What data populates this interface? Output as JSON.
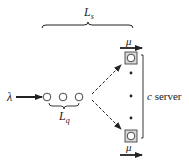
{
  "diagram": {
    "type": "queueing-system",
    "labels": {
      "arrival_rate": "λ",
      "system_length": "L",
      "system_length_sub": "s",
      "queue_length": "L",
      "queue_length_sub": "q",
      "service_rate_top": "μ",
      "service_rate_bottom": "μ",
      "servers_var": "c",
      "servers_text": " server"
    },
    "queue_customers": 3,
    "visible_servers": 2,
    "ellipsis_dots": 3,
    "colors": {
      "stroke": "#222222",
      "server_fill": "#d9d9d9"
    }
  }
}
